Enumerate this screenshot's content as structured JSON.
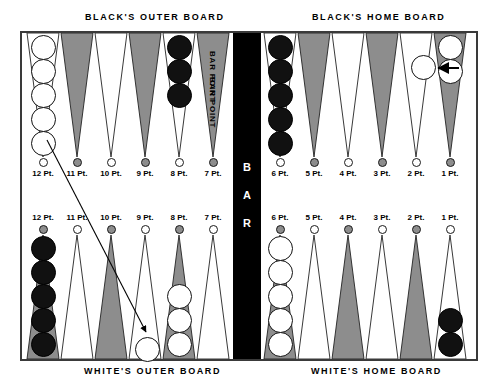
{
  "figure": {
    "type": "backgammon-board-diagram"
  },
  "captions": {
    "black_outer": "BLACK'S OUTER BOARD",
    "black_home": "BLACK'S HOME BOARD",
    "white_outer": "WHITE'S OUTER BOARD",
    "white_home": "WHITE'S HOME BOARD"
  },
  "bar": {
    "label": "B A R",
    "color": "#000000"
  },
  "bar_point_label": "BAR POINT",
  "colors": {
    "triangle_dark": "#8d8d8d",
    "triangle_light": "#ffffff",
    "checker_white": "#ffffff",
    "checker_black": "#111111",
    "frame": "#3a3a3a",
    "bar": "#000000"
  },
  "point_label_suffix": "Pt.",
  "top_row": {
    "points": [
      {
        "number": "12",
        "label": "12 Pt.",
        "shade": "light",
        "tip": "white",
        "checkers": {
          "color": "white",
          "count": 5
        }
      },
      {
        "number": "11",
        "label": "11 Pt.",
        "shade": "dark",
        "tip": "gray",
        "checkers": {
          "color": "none",
          "count": 0
        }
      },
      {
        "number": "10",
        "label": "10 Pt.",
        "shade": "light",
        "tip": "white",
        "checkers": {
          "color": "none",
          "count": 0
        }
      },
      {
        "number": "9",
        "label": "9 Pt.",
        "shade": "dark",
        "tip": "gray",
        "checkers": {
          "color": "none",
          "count": 0
        }
      },
      {
        "number": "8",
        "label": "8 Pt.",
        "shade": "light",
        "tip": "white",
        "checkers": {
          "color": "black",
          "count": 3
        }
      },
      {
        "number": "7",
        "label": "7 Pt.",
        "shade": "dark",
        "tip": "gray",
        "checkers": {
          "color": "none",
          "count": 0
        },
        "note": "BAR POINT"
      },
      {
        "number": "6",
        "label": "6 Pt.",
        "shade": "light",
        "tip": "white",
        "checkers": {
          "color": "black",
          "count": 5
        }
      },
      {
        "number": "5",
        "label": "5 Pt.",
        "shade": "dark",
        "tip": "gray",
        "checkers": {
          "color": "none",
          "count": 0
        }
      },
      {
        "number": "4",
        "label": "4 Pt.",
        "shade": "light",
        "tip": "white",
        "checkers": {
          "color": "none",
          "count": 0
        }
      },
      {
        "number": "3",
        "label": "3 Pt.",
        "shade": "dark",
        "tip": "gray",
        "checkers": {
          "color": "none",
          "count": 0
        }
      },
      {
        "number": "2",
        "label": "2 Pt.",
        "shade": "light",
        "tip": "white",
        "checkers": {
          "color": "none",
          "count": 0
        }
      },
      {
        "number": "1",
        "label": "1 Pt.",
        "shade": "dark",
        "tip": "gray",
        "checkers": {
          "color": "white",
          "count": 2
        }
      }
    ]
  },
  "bottom_row": {
    "points": [
      {
        "number": "12",
        "label": "12 Pt.",
        "shade": "dark",
        "tip": "gray",
        "checkers": {
          "color": "black",
          "count": 5
        }
      },
      {
        "number": "11",
        "label": "11 Pt.",
        "shade": "light",
        "tip": "white",
        "checkers": {
          "color": "none",
          "count": 0
        }
      },
      {
        "number": "10",
        "label": "10 Pt.",
        "shade": "dark",
        "tip": "gray",
        "checkers": {
          "color": "none",
          "count": 0
        }
      },
      {
        "number": "9",
        "label": "9 Pt.",
        "shade": "light",
        "tip": "white",
        "checkers": {
          "color": "none",
          "count": 0
        }
      },
      {
        "number": "8",
        "label": "8 Pt.",
        "shade": "dark",
        "tip": "gray",
        "checkers": {
          "color": "white",
          "count": 3
        }
      },
      {
        "number": "7",
        "label": "7 Pt.",
        "shade": "light",
        "tip": "white",
        "checkers": {
          "color": "none",
          "count": 0
        },
        "note": "BAR POINT"
      },
      {
        "number": "6",
        "label": "6 Pt.",
        "shade": "dark",
        "tip": "gray",
        "checkers": {
          "color": "white",
          "count": 5
        }
      },
      {
        "number": "5",
        "label": "5 Pt.",
        "shade": "light",
        "tip": "white",
        "checkers": {
          "color": "none",
          "count": 0
        }
      },
      {
        "number": "4",
        "label": "4 Pt.",
        "shade": "dark",
        "tip": "gray",
        "checkers": {
          "color": "none",
          "count": 0
        }
      },
      {
        "number": "3",
        "label": "3 Pt.",
        "shade": "light",
        "tip": "white",
        "checkers": {
          "color": "none",
          "count": 0
        }
      },
      {
        "number": "2",
        "label": "2 Pt.",
        "shade": "dark",
        "tip": "gray",
        "checkers": {
          "color": "none",
          "count": 0
        }
      },
      {
        "number": "1",
        "label": "1 Pt.",
        "shade": "light",
        "tip": "white",
        "checkers": {
          "color": "black",
          "count": 2
        }
      }
    ]
  },
  "moves": [
    {
      "id": "move-long",
      "from": "top 12 Pt.",
      "to": "bottom 11 Pt.",
      "checker_color": "white",
      "style": "long diagonal arrow"
    },
    {
      "id": "move-short",
      "from": "top 1 Pt.",
      "to": "top 2 Pt.",
      "checker_color": "white",
      "style": "short horizontal arrow"
    }
  ]
}
